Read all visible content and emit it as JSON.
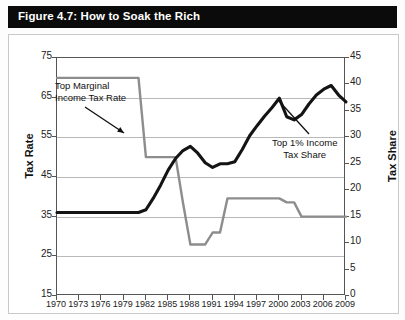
{
  "figure": {
    "title": "Figure 4.7: How to Soak the Rich"
  },
  "axes": {
    "left_title": "Tax Rate",
    "right_title": "Tax Share",
    "left_ticks": [
      "75",
      "65",
      "55",
      "45",
      "35",
      "25",
      "15"
    ],
    "right_ticks": [
      "45",
      "40",
      "35",
      "30",
      "25",
      "20",
      "15",
      "10",
      "5",
      "0"
    ],
    "x_ticks": [
      "1970",
      "1973",
      "1976",
      "1979",
      "1982",
      "1985",
      "1988",
      "1991",
      "1994",
      "1997",
      "2000",
      "2003",
      "2006",
      "2009"
    ]
  },
  "annotations": {
    "marginal_rate": "Top Marginal\nIncome Tax Rate",
    "income_share": "Top 1% Income\nTax Share"
  },
  "colors": {
    "title_bar": "#0b0b0b",
    "title_text": "#ffffff",
    "marginal_line": "#8d8d8d",
    "share_line": "#141414",
    "gridline": "#b9b9b9",
    "axis": "#555555"
  },
  "chart_data": {
    "type": "line",
    "title": "Figure 4.7: How to Soak the Rich",
    "xlabel": "",
    "ylabel": "Tax Rate",
    "y2label": "Tax Share",
    "xlim": [
      1970,
      2009
    ],
    "ylim": [
      15,
      75
    ],
    "y2lim": [
      0,
      45
    ],
    "grid": true,
    "legend": "annotations",
    "x": [
      1970,
      1971,
      1972,
      1973,
      1974,
      1975,
      1976,
      1977,
      1978,
      1979,
      1980,
      1981,
      1982,
      1983,
      1984,
      1985,
      1986,
      1987,
      1988,
      1989,
      1990,
      1991,
      1992,
      1993,
      1994,
      1995,
      1996,
      1997,
      1998,
      1999,
      2000,
      2001,
      2002,
      2003,
      2004,
      2005,
      2006,
      2007,
      2008,
      2009
    ],
    "series": [
      {
        "name": "Top Marginal Income Tax Rate",
        "axis": "left",
        "color": "#8d8d8d",
        "values": [
          70,
          70,
          70,
          70,
          70,
          70,
          70,
          70,
          70,
          70,
          70,
          70,
          50,
          50,
          50,
          50,
          50,
          38.5,
          28,
          28,
          28,
          31,
          31,
          39.6,
          39.6,
          39.6,
          39.6,
          39.6,
          39.6,
          39.6,
          39.6,
          38.6,
          38.6,
          35,
          35,
          35,
          35,
          35,
          35,
          35
        ]
      },
      {
        "name": "Top 1% Income Tax Share",
        "axis": "right",
        "color": "#141414",
        "values": [
          15.8,
          15.8,
          15.8,
          15.8,
          15.8,
          15.8,
          15.8,
          15.8,
          15.8,
          15.8,
          15.8,
          15.8,
          16.3,
          18.5,
          21.0,
          23.8,
          26.0,
          27.5,
          28.3,
          27.0,
          25.2,
          24.3,
          25.0,
          25.0,
          25.4,
          27.7,
          30.3,
          32.2,
          34.0,
          35.6,
          37.4,
          33.9,
          33.3,
          34.3,
          36.3,
          38.0,
          39.1,
          39.8,
          38.0,
          36.7
        ]
      }
    ],
    "annotations": [
      {
        "text": "Top Marginal Income Tax Rate",
        "points_to_year": 1982,
        "points_to_value": 57
      },
      {
        "text": "Top 1% Income Tax Share",
        "points_to_year": 2000,
        "points_to_value": 37.4
      }
    ]
  }
}
